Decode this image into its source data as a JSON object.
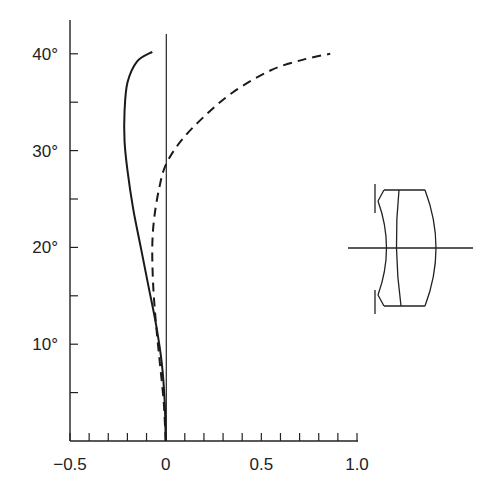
{
  "chart_data": {
    "type": "line",
    "title": "",
    "xlabel": "",
    "ylabel": "",
    "xlim": [
      -0.5,
      1.0
    ],
    "ylim": [
      0,
      42
    ],
    "x_ticks": [
      -0.5,
      0,
      0.5,
      1.0
    ],
    "x_tick_labels": [
      "−0.5",
      "0",
      "0.5",
      "1.0"
    ],
    "x_minor_step": 0.1,
    "y_ticks": [
      10,
      20,
      30,
      40
    ],
    "y_tick_labels": [
      "10°",
      "20°",
      "30°",
      "40°"
    ],
    "y_minor_step": 5,
    "grid": false,
    "legend": null,
    "series": [
      {
        "name": "solid",
        "style": "solid",
        "points": [
          [
            0,
            0
          ],
          [
            -0.005,
            4
          ],
          [
            -0.02,
            8
          ],
          [
            -0.05,
            12
          ],
          [
            -0.09,
            16
          ],
          [
            -0.13,
            20
          ],
          [
            -0.17,
            24
          ],
          [
            -0.2,
            28
          ],
          [
            -0.215,
            31
          ],
          [
            -0.215,
            34
          ],
          [
            -0.2,
            37
          ],
          [
            -0.15,
            39.2
          ],
          [
            -0.07,
            40.2
          ]
        ]
      },
      {
        "name": "dashed",
        "style": "dashed",
        "points": [
          [
            0,
            0
          ],
          [
            -0.01,
            4
          ],
          [
            -0.03,
            8
          ],
          [
            -0.05,
            12
          ],
          [
            -0.065,
            16
          ],
          [
            -0.07,
            20
          ],
          [
            -0.06,
            23
          ],
          [
            -0.035,
            26
          ],
          [
            0,
            28.5
          ],
          [
            0.08,
            31
          ],
          [
            0.2,
            33.5
          ],
          [
            0.35,
            36
          ],
          [
            0.55,
            38.3
          ],
          [
            0.72,
            39.4
          ],
          [
            0.86,
            40
          ]
        ]
      }
    ],
    "annotations": [
      {
        "type": "lens-diagram",
        "description": "Lens cross-section with aperture stops at front, on optical axis"
      }
    ]
  }
}
